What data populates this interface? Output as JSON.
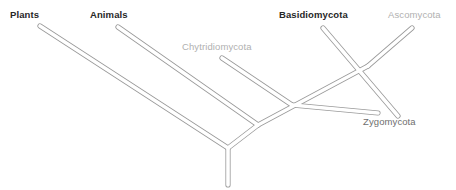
{
  "figure": {
    "kind": "phylogenetic-tree",
    "width": 456,
    "height": 190,
    "background": "#ffffff"
  },
  "style": {
    "branch_outline_color": "#9a9a9a",
    "branch_fill_color": "#ffffff",
    "emphasis_text_color": "#272727",
    "muted_text_color": "#b0b0b0",
    "mid_text_color": "#6e6e6e"
  },
  "labels": {
    "plants": "Plants",
    "animals": "Animals",
    "chytridiomycota": "Chytridiomycota",
    "basidiomycota": "Basidiomycota",
    "ascomycota": "Ascomycota",
    "zygomycota": "Zygomycota"
  },
  "taxa": [
    {
      "id": "plants",
      "label": "Plants",
      "emphasis": "bold",
      "color": "#272727",
      "label_x": 10,
      "label_y": 10,
      "tip_x": 40,
      "tip_y": 26
    },
    {
      "id": "animals",
      "label": "Animals",
      "emphasis": "bold",
      "color": "#272727",
      "label_x": 90,
      "label_y": 10,
      "tip_x": 118,
      "tip_y": 27
    },
    {
      "id": "chytridiomycota",
      "label": "Chytridiomycota",
      "emphasis": "light",
      "color": "#b0b0b0",
      "label_x": 182,
      "label_y": 42,
      "tip_x": 222,
      "tip_y": 58
    },
    {
      "id": "basidiomycota",
      "label": "Basidiomycota",
      "emphasis": "bold",
      "color": "#272727",
      "label_x": 279,
      "label_y": 10,
      "tip_x": 323,
      "tip_y": 28
    },
    {
      "id": "ascomycota",
      "label": "Ascomycota",
      "emphasis": "light",
      "color": "#b0b0b0",
      "label_x": 388,
      "label_y": 10,
      "tip_x": 412,
      "tip_y": 28
    },
    {
      "id": "zygomycota",
      "label": "Zygomycota",
      "emphasis": "medium",
      "color": "#6e6e6e",
      "label_x": 363,
      "label_y": 117,
      "tip_x": 378,
      "tip_y": 113
    }
  ],
  "nodes": [
    {
      "id": "root",
      "x": 228,
      "y": 148
    },
    {
      "id": "root-stem",
      "x": 228,
      "y": 185
    },
    {
      "id": "node-animals-fungi",
      "x": 258,
      "y": 125
    },
    {
      "id": "node-fungi",
      "x": 292,
      "y": 105
    },
    {
      "id": "node-dikarya",
      "x": 368,
      "y": 66
    }
  ],
  "branches": [
    {
      "id": "branch-plants",
      "from": "tip-plants",
      "to": "root"
    },
    {
      "id": "branch-animals",
      "from": "tip-animals",
      "to": "node-animals-fungi"
    },
    {
      "id": "branch-root-to-animals",
      "from": "root",
      "to": "node-animals-fungi"
    },
    {
      "id": "branch-chytridiomycota",
      "from": "tip-chytridiomycota",
      "to": "node-fungi"
    },
    {
      "id": "branch-fungi-spine",
      "from": "node-animals-fungi",
      "to": "node-dikarya"
    },
    {
      "id": "branch-basidiomycota",
      "from": "tip-basidiomycota",
      "to": "node-crossing"
    },
    {
      "id": "branch-ascomycota",
      "from": "tip-ascomycota",
      "to": "node-dikarya"
    },
    {
      "id": "branch-zygomycota",
      "from": "node-fungi",
      "to": "tip-zygomycota"
    },
    {
      "id": "branch-root-stem",
      "from": "root",
      "to": "root-stem"
    }
  ]
}
